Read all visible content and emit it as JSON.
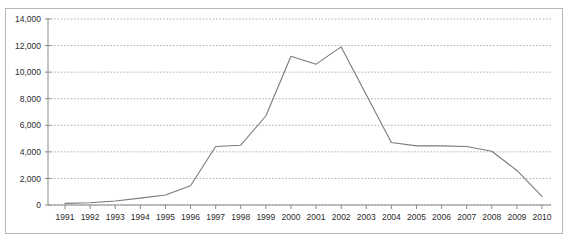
{
  "caption": "",
  "colors": {
    "line": "#7a7a7a",
    "grid": "#8e8e8e",
    "axis": "#8a8a8a",
    "frame": "#b6b6b6",
    "text": "#2b2b2b",
    "background": "#ffffff"
  },
  "chart_data": {
    "type": "line",
    "title": "",
    "subtitle": "",
    "xlabel": "",
    "ylabel": "",
    "categories": [
      "1991",
      "1992",
      "1993",
      "1994",
      "1995",
      "1996",
      "1997",
      "1998",
      "1999",
      "2000",
      "2001",
      "2002",
      "2003",
      "2004",
      "2005",
      "2006",
      "2007",
      "2008",
      "2009",
      "2010"
    ],
    "values": [
      120,
      170,
      300,
      520,
      750,
      1450,
      4400,
      4500,
      6700,
      11200,
      10600,
      11900,
      8300,
      4700,
      4450,
      4450,
      4400,
      4050,
      2600,
      650
    ],
    "series": [
      {
        "name": "",
        "values": [
          120,
          170,
          300,
          520,
          750,
          1450,
          4400,
          4500,
          6700,
          11200,
          10600,
          11900,
          8300,
          4700,
          4450,
          4450,
          4400,
          4050,
          2600,
          650
        ]
      }
    ],
    "ylim": [
      0,
      14000
    ],
    "yticks": [
      0,
      2000,
      4000,
      6000,
      8000,
      10000,
      12000,
      14000
    ],
    "ytick_labels": [
      "0",
      "2,000",
      "4,000",
      "6,000",
      "8,000",
      "10,000",
      "12,000",
      "14,000"
    ],
    "xtick_labels": [
      "1991",
      "1992",
      "1993",
      "1994",
      "1995",
      "1996",
      "1997",
      "1998",
      "1999",
      "2000",
      "2001",
      "2002",
      "2003",
      "2004",
      "2005",
      "2006",
      "2007",
      "2008",
      "2009",
      "2010"
    ],
    "grid": true,
    "grid_style": "dotted-horizontal",
    "legend": false,
    "legend_position": "none",
    "markers": false
  }
}
